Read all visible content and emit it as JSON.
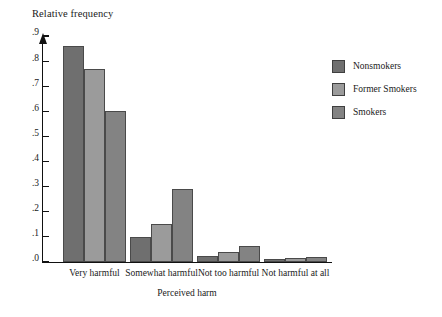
{
  "chart_data": {
    "type": "bar",
    "title": "",
    "ylabel": "Relative frequency",
    "xlabel": "Perceived harm",
    "categories": [
      "Very harmful",
      "Somewhat harmful",
      "Not too harmful",
      "Not harmful at all"
    ],
    "series": [
      {
        "name": "Nonsmokers",
        "color": "#6f6f6f",
        "values": [
          0.86,
          0.1,
          0.025,
          0.01
        ]
      },
      {
        "name": "Former Smokers",
        "color": "#9b9b9b",
        "values": [
          0.77,
          0.15,
          0.04,
          0.015
        ]
      },
      {
        "name": "Smokers",
        "color": "#838383",
        "values": [
          0.6,
          0.29,
          0.065,
          0.02
        ]
      }
    ],
    "ylim": [
      0,
      0.9
    ],
    "ytick_labels": [
      ".0",
      ".1",
      ".2",
      ".3",
      ".4",
      ".5",
      ".6",
      ".7",
      ".8",
      ".9"
    ],
    "ytick_values": [
      0.0,
      0.1,
      0.2,
      0.3,
      0.4,
      0.5,
      0.6,
      0.7,
      0.8,
      0.9
    ],
    "grid": false,
    "legend_position": "right"
  },
  "legend": {
    "entries": [
      {
        "label": "Nonsmokers"
      },
      {
        "label": "Former Smokers"
      },
      {
        "label": "Smokers"
      }
    ]
  }
}
